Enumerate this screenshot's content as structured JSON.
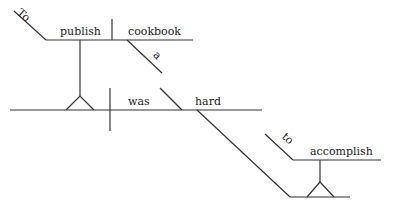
{
  "diagram": {
    "type": "sentence-diagram",
    "sentence_words": [
      "To",
      "publish",
      "cookbook",
      "a",
      "was",
      "hard",
      "to",
      "accomplish"
    ],
    "words": {
      "to_infinitive_marker": "To",
      "infinitive_verb": "publish",
      "object": "cookbook",
      "article": "a",
      "main_verb": "was",
      "predicate_adjective": "hard",
      "to_marker_2": "to",
      "complement_verb": "accomplish"
    },
    "line_color": "#333333",
    "text_color": "#222222"
  }
}
